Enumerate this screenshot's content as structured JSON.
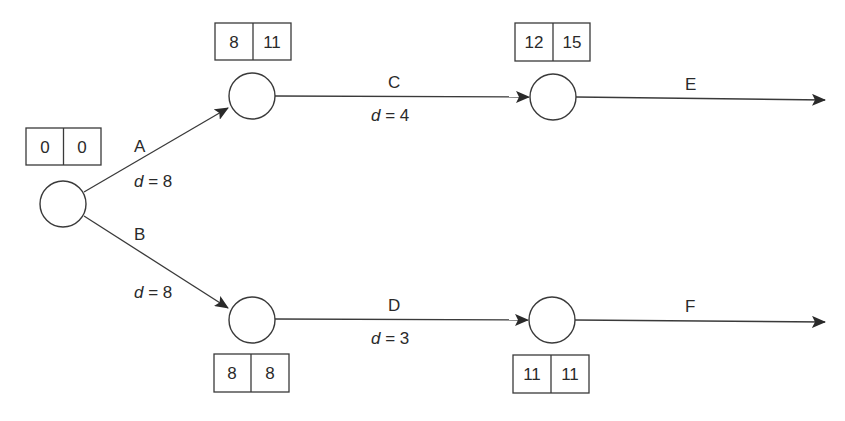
{
  "diagram": {
    "type": "activity-on-arrow network",
    "nodes": [
      {
        "id": "n1",
        "cx": 63,
        "cy": 204,
        "times": {
          "earliest": "0",
          "latest": "0"
        },
        "box": {
          "x": 26,
          "y": 128
        }
      },
      {
        "id": "n2",
        "cx": 252,
        "cy": 96,
        "times": {
          "earliest": "8",
          "latest": "11"
        },
        "box": {
          "x": 215,
          "y": 23
        }
      },
      {
        "id": "n3",
        "cx": 252,
        "cy": 320,
        "times": {
          "earliest": "8",
          "latest": "8"
        },
        "box": {
          "x": 214,
          "y": 354
        }
      },
      {
        "id": "n4",
        "cx": 553,
        "cy": 97,
        "times": {
          "earliest": "12",
          "latest": "15"
        },
        "box": {
          "x": 515,
          "y": 23
        }
      },
      {
        "id": "n5",
        "cx": 552,
        "cy": 320,
        "times": {
          "earliest": "11",
          "latest": "11"
        },
        "box": {
          "x": 513,
          "y": 355
        }
      }
    ],
    "activities": [
      {
        "id": "A",
        "label": "A",
        "from": "n1",
        "to": "n2",
        "duration_var": "d",
        "duration_eq": " = 8"
      },
      {
        "id": "B",
        "label": "B",
        "from": "n1",
        "to": "n3",
        "duration_var": "d",
        "duration_eq": " = 8"
      },
      {
        "id": "C",
        "label": "C",
        "from": "n2",
        "to": "n4",
        "duration_var": "d",
        "duration_eq": " = 4"
      },
      {
        "id": "D",
        "label": "D",
        "from": "n3",
        "to": "n5",
        "duration_var": "d",
        "duration_eq": " = 3"
      },
      {
        "id": "E",
        "label": "E",
        "from": "n4",
        "to": null
      },
      {
        "id": "F",
        "label": "F",
        "from": "n5",
        "to": null
      }
    ]
  }
}
